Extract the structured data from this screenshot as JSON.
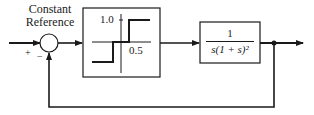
{
  "diagram": {
    "type": "feedback-control-block-diagram",
    "reference_label_line1": "Constant",
    "reference_label_line2": "Reference",
    "summing_junction": {
      "plus_sign": "+",
      "minus_sign": "−"
    },
    "nonlinearity_block": {
      "kind": "relay-with-dead-zone",
      "upper_level_label": "1.0",
      "dead_zone_label": "0.5"
    },
    "plant_block": {
      "numerator": "1",
      "denominator": "s(1 + s)²"
    },
    "feedback": "unity negative feedback"
  }
}
